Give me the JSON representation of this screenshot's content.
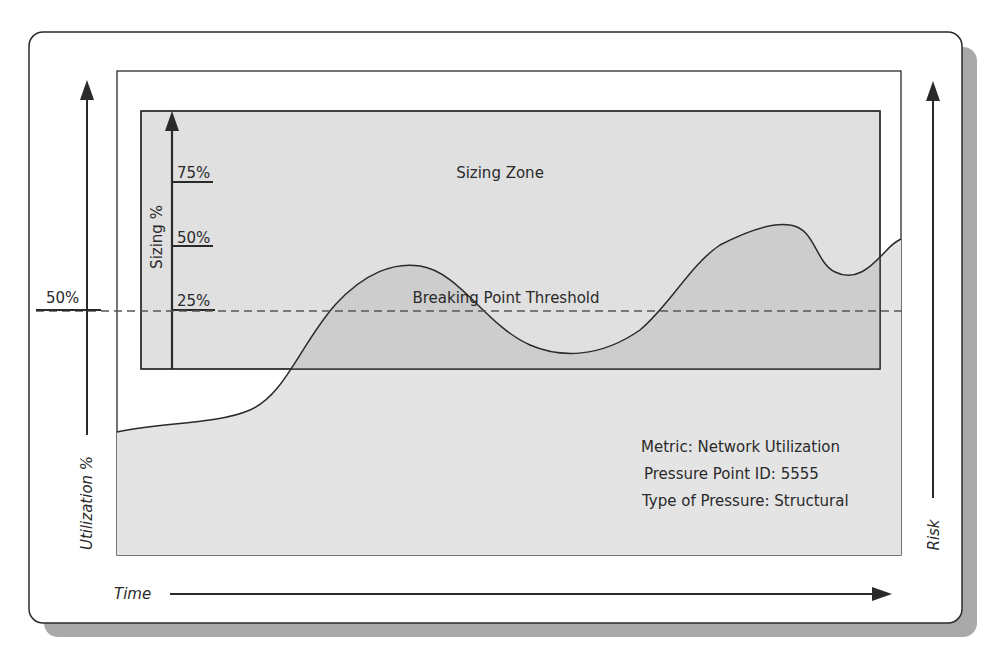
{
  "diagram": {
    "sizing_zone_label": "Sizing Zone",
    "sizing_axis_label": "Sizing %",
    "sizing_ticks": [
      "75%",
      "50%",
      "25%"
    ],
    "threshold_label": "Breaking Point Threshold",
    "threshold_value": "50%",
    "y_axis_left_label": "Utilization %",
    "y_axis_right_label": "Risk",
    "x_axis_label": "Time",
    "info": {
      "metric": "Metric: Network Utilization",
      "pressure_point": "Pressure Point ID: 5555",
      "pressure_type": "Type of Pressure: Structural"
    }
  },
  "colors": {
    "chart_fill": "#e6e6e6",
    "zone_fill": "#dcdcdc",
    "area_fill": "#cfcfcf",
    "shadow": "#a9a9a9",
    "line": "#2a2a2a"
  }
}
